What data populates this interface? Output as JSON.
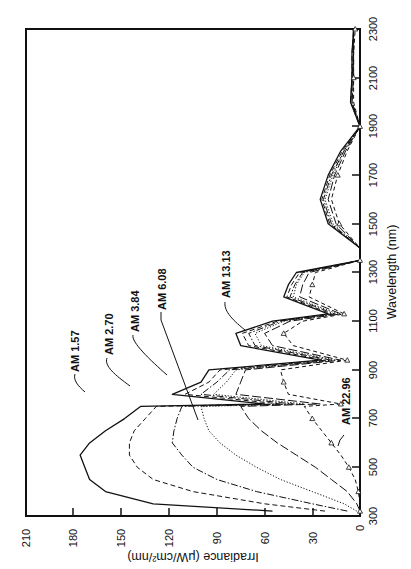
{
  "chart_data": {
    "type": "line",
    "orientation": "rotated-90-ccw",
    "title": "",
    "xlabel": "Wavelength (nm)",
    "ylabel": "Irradiance (μW/cm²/nm)",
    "xlim": [
      300,
      2300
    ],
    "ylim": [
      0,
      210
    ],
    "x_ticks": [
      300,
      500,
      700,
      900,
      1100,
      1300,
      1500,
      1700,
      1900,
      2100,
      2300
    ],
    "y_ticks": [
      0,
      30,
      60,
      90,
      120,
      150,
      180,
      210
    ],
    "grid": false,
    "legend": "inline curve labels with leader lines",
    "x": [
      320,
      350,
      400,
      450,
      500,
      550,
      600,
      650,
      700,
      750,
      760,
      800,
      850,
      900,
      940,
      1000,
      1050,
      1100,
      1130,
      1200,
      1250,
      1300,
      1350,
      1400,
      1500,
      1600,
      1700,
      1800,
      1900,
      2000,
      2100,
      2200,
      2300
    ],
    "series": [
      {
        "name": "AM 1.57",
        "style": "solid",
        "values": [
          55,
          130,
          160,
          170,
          173,
          176,
          170,
          160,
          148,
          138,
          60,
          118,
          100,
          95,
          25,
          75,
          78,
          55,
          20,
          48,
          45,
          40,
          0,
          0,
          20,
          25,
          20,
          12,
          0,
          6,
          5,
          5,
          4
        ]
      },
      {
        "name": "AM 2.70",
        "style": "dashed",
        "values": [
          22,
          60,
          105,
          130,
          140,
          145,
          145,
          142,
          135,
          128,
          50,
          110,
          95,
          88,
          22,
          70,
          74,
          52,
          18,
          46,
          43,
          38,
          0,
          0,
          19,
          24,
          19,
          11,
          0,
          6,
          5,
          5,
          4
        ]
      },
      {
        "name": "AM 3.84",
        "style": "dash-dot",
        "values": [
          8,
          30,
          65,
          90,
          105,
          112,
          118,
          117,
          115,
          112,
          42,
          100,
          90,
          82,
          18,
          66,
          70,
          50,
          16,
          44,
          41,
          36,
          0,
          0,
          18,
          23,
          18,
          10,
          0,
          5,
          5,
          4,
          4
        ]
      },
      {
        "name": "AM 6.08",
        "style": "dotted",
        "values": [
          2,
          10,
          30,
          50,
          65,
          78,
          88,
          95,
          98,
          100,
          35,
          92,
          84,
          78,
          15,
          62,
          66,
          48,
          14,
          42,
          40,
          35,
          0,
          0,
          17,
          22,
          17,
          10,
          0,
          5,
          5,
          4,
          4
        ]
      },
      {
        "name": "AM 13.13",
        "style": "long-dash",
        "values": [
          0,
          2,
          8,
          18,
          28,
          40,
          52,
          62,
          70,
          75,
          25,
          78,
          75,
          72,
          12,
          55,
          60,
          44,
          12,
          38,
          36,
          32,
          0,
          0,
          15,
          20,
          16,
          9,
          0,
          5,
          4,
          4,
          4
        ]
      },
      {
        "name": "AM 22.96",
        "style": "dash-triangle-markers",
        "values": [
          0,
          0,
          1,
          3,
          7,
          12,
          18,
          24,
          30,
          35,
          12,
          45,
          48,
          50,
          8,
          42,
          48,
          36,
          10,
          32,
          30,
          28,
          0,
          0,
          13,
          18,
          14,
          8,
          0,
          4,
          4,
          4,
          3
        ]
      }
    ],
    "annotations": [
      "AM 1.57",
      "AM 2.70",
      "AM 3.84",
      "AM 6.08",
      "AM 13.13",
      "AM 22.96"
    ]
  },
  "axes": {
    "x_title": "Wavelength (nm)",
    "y_title": "Irradiance (μW/cm²/nm)",
    "x_tick_labels": [
      "300",
      "500",
      "700",
      "900",
      "1100",
      "1300",
      "1500",
      "1700",
      "1900",
      "2100",
      "2300"
    ],
    "y_tick_labels": [
      "0",
      "30",
      "60",
      "90",
      "120",
      "150",
      "180",
      "210"
    ]
  },
  "labels": {
    "am157": "AM 1.57",
    "am270": "AM 2.70",
    "am384": "AM 3.84",
    "am608": "AM 6.08",
    "am1313": "AM 13.13",
    "am2296": "AM 22.96"
  },
  "colors": {
    "ink": "#111111",
    "background": "#ffffff"
  }
}
